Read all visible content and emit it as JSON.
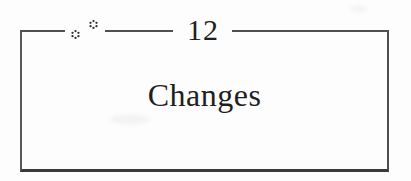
{
  "chapter": {
    "number": "12",
    "title": "Changes"
  },
  "ornaments": {
    "icon": "dotted-florette-icon",
    "count": 2
  },
  "colors": {
    "background": "#fdfdfd",
    "box_border": "#555555",
    "box_border_bottom": "#3a3a3a",
    "top_rule": "#4f4f4f",
    "text": "#1f1f1f",
    "ornament": "#2e2e2e"
  }
}
